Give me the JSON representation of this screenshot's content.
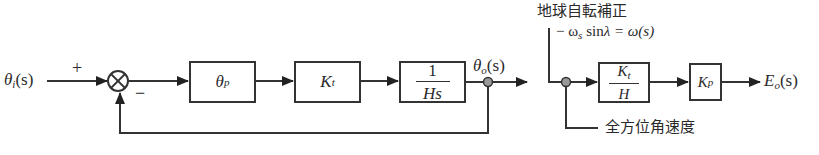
{
  "diagram": {
    "type": "block-diagram",
    "input": {
      "symbol": "θ",
      "sub": "i",
      "arg": "(s)"
    },
    "summing_junction": {
      "plus_label": "+",
      "minus_label": "−"
    },
    "blocks": [
      {
        "id": "theta_p",
        "symbol": "θ",
        "sub": "p"
      },
      {
        "id": "Kt",
        "symbol": "K",
        "sub": "t"
      },
      {
        "id": "one_over_Hs",
        "num": "1",
        "den": "Hs"
      },
      {
        "id": "Kt_over_H",
        "num_symbol": "K",
        "num_sub": "t",
        "den": "H"
      },
      {
        "id": "Kp",
        "symbol": "K",
        "sub": "p"
      }
    ],
    "output_theta": {
      "symbol": "θ",
      "sub": "o",
      "arg": "(s)"
    },
    "correction": {
      "title": "地球自転補正",
      "eq_prefix": "− ω",
      "eq_sub": "s",
      "eq_sin": " sin",
      "eq_lambda": "λ",
      "eq_rest": " = ω(s)"
    },
    "final_output": {
      "symbol": "E",
      "sub": "o",
      "arg": "(s)"
    },
    "bottom_label": "全方位角速度"
  }
}
